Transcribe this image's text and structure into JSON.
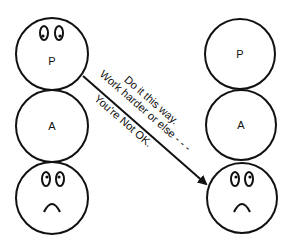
{
  "diagram": {
    "left_person": {
      "top": {
        "label": "P",
        "face": "eyes"
      },
      "middle": {
        "label": "A"
      },
      "bottom": {
        "label": "",
        "face": "sad"
      }
    },
    "right_person": {
      "top": {
        "label": "P"
      },
      "middle": {
        "label": "A"
      },
      "bottom": {
        "label": "",
        "face": "sad"
      }
    },
    "arrow": {
      "from": "left_person.top",
      "to": "right_person.bottom",
      "messages": [
        "Do it this way.",
        "Work harder or else - - -",
        "You're Not OK."
      ]
    },
    "colors": {
      "stroke": "#111111",
      "background": "#ffffff"
    }
  }
}
